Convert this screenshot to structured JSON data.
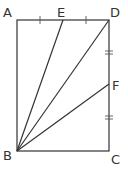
{
  "diagram": {
    "points": {
      "A": {
        "label": "A",
        "x": 17,
        "y": 20
      },
      "D": {
        "label": "D",
        "x": 109,
        "y": 20
      },
      "B": {
        "label": "B",
        "x": 17,
        "y": 151
      },
      "C": {
        "label": "C",
        "x": 109,
        "y": 151
      },
      "E": {
        "label": "E",
        "x": 63,
        "y": 20
      },
      "F": {
        "label": "F",
        "x": 109,
        "y": 84
      }
    },
    "segments": [
      "AD",
      "DC",
      "CB",
      "BA",
      "BE",
      "BD",
      "BF"
    ],
    "equal_marks": {
      "single": [
        "AE",
        "ED"
      ],
      "double": [
        "DF",
        "FC"
      ]
    },
    "colors": {
      "line": "#333333",
      "background": "#ffffff"
    }
  }
}
